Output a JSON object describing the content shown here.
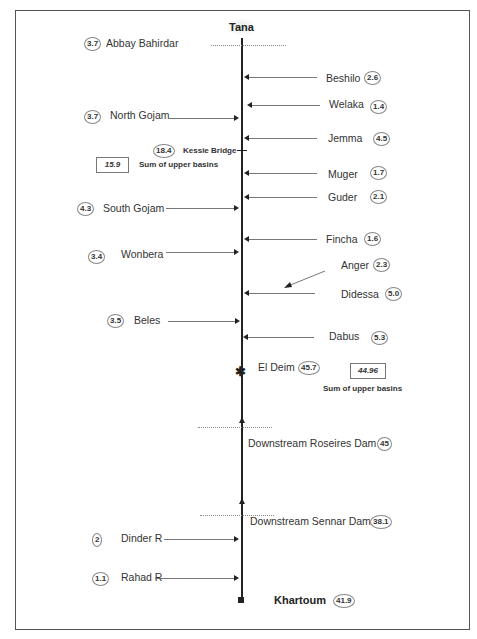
{
  "title": "Tana",
  "terminal": {
    "label": "Khartoum",
    "value": "41.9"
  },
  "abbay": {
    "label": "Abbay Bahirdar",
    "value": "3.7"
  },
  "right_tributaries": [
    {
      "label": "Beshilo",
      "value": "2.6"
    },
    {
      "label": "Welaka",
      "value": "1.4"
    },
    {
      "label": "Jemma",
      "value": "4.5"
    },
    {
      "label": "Muger",
      "value": "1.7"
    },
    {
      "label": "Guder",
      "value": "2.1"
    },
    {
      "label": "Fincha",
      "value": "1.6"
    },
    {
      "label": "Anger",
      "value": "2.3"
    },
    {
      "label": "Didessa",
      "value": "5.0"
    },
    {
      "label": "Dabus",
      "value": "5.3"
    }
  ],
  "left_tributaries": [
    {
      "label": "North Gojam",
      "value": "3.7"
    },
    {
      "label": "South Gojam",
      "value": "4.3"
    },
    {
      "label": "Wonbera",
      "value": "3.4"
    },
    {
      "label": "Beles",
      "value": "3.5"
    },
    {
      "label": "Dinder R",
      "value": "2"
    },
    {
      "label": "Rahad R",
      "value": "1.1"
    }
  ],
  "stations": {
    "kessie": {
      "label": "Kessie Bridge",
      "value": "18.4",
      "sum_value": "15.9",
      "sum_label": "Sum of upper basins"
    },
    "eldeim": {
      "label": "El Deim",
      "value": "45.7",
      "sum_value": "44.96",
      "sum_label": "Sum of upper basins"
    },
    "roseires": {
      "label": "Downstream Roseires Dam",
      "value": "45"
    },
    "sennar": {
      "label": "Downstream Sennar Dam",
      "value": "38.1"
    }
  }
}
